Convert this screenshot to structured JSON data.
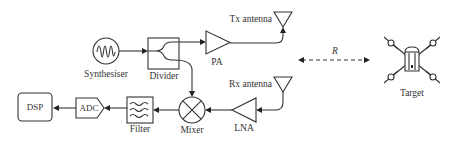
{
  "diagram": {
    "type": "radar-system-block-diagram",
    "blocks": {
      "synthesiser": {
        "label": "Synthesiser",
        "icon": "sine-wave-source-icon"
      },
      "divider": {
        "label": "Divider",
        "icon": "power-divider-icon"
      },
      "pa": {
        "label": "PA",
        "icon": "amplifier-triangle-icon"
      },
      "tx_antenna": {
        "label": "Tx antenna",
        "icon": "antenna-icon"
      },
      "rx_antenna": {
        "label": "Rx antenna",
        "icon": "antenna-icon"
      },
      "lna": {
        "label": "LNA",
        "icon": "amplifier-triangle-icon"
      },
      "mixer": {
        "label": "Mixer",
        "icon": "mixer-x-circle-icon"
      },
      "filter": {
        "label": "Filter",
        "icon": "filter-waves-icon"
      },
      "adc": {
        "label": "ADC"
      },
      "dsp": {
        "label": "DSP"
      },
      "target": {
        "label": "Target",
        "icon": "drone-quadcopter-icon"
      }
    },
    "range_label": "R",
    "connections": [
      {
        "from": "Synthesiser",
        "to": "Divider"
      },
      {
        "from": "Divider",
        "to": "PA"
      },
      {
        "from": "PA",
        "to": "Tx antenna"
      },
      {
        "from": "Divider",
        "to": "Mixer"
      },
      {
        "from": "Rx antenna",
        "to": "LNA"
      },
      {
        "from": "LNA",
        "to": "Mixer"
      },
      {
        "from": "Mixer",
        "to": "Filter"
      },
      {
        "from": "Filter",
        "to": "ADC"
      },
      {
        "from": "ADC",
        "to": "DSP"
      },
      {
        "from": "Radar",
        "to": "Target",
        "style": "dashed-bidirectional",
        "label": "R"
      }
    ]
  }
}
